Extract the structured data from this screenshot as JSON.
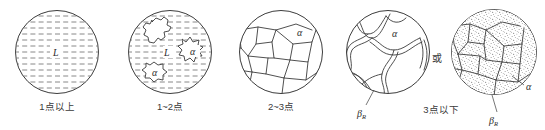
{
  "figure": {
    "title_present": false,
    "panels": [
      {
        "id": "panel-1",
        "caption": "1点以上",
        "phase_labels": [
          "L"
        ],
        "pattern": "horizontal-dashed-liquid",
        "blob_count": 0,
        "cx": 57,
        "cy": 52,
        "r": 42
      },
      {
        "id": "panel-2",
        "caption": "1~2点",
        "phase_labels": [
          "L",
          "α",
          "α"
        ],
        "pattern": "horizontal-dashed-liquid-with-alpha-blobs",
        "blob_count": 3,
        "cx": 170,
        "cy": 52,
        "r": 42
      },
      {
        "id": "panel-3",
        "caption": "2~3点",
        "phase_labels": [
          "α"
        ],
        "pattern": "polygonal-grains",
        "blob_count": 0,
        "cx": 281,
        "cy": 52,
        "r": 42
      },
      {
        "id": "panel-4",
        "caption": "3点以下",
        "phase_labels": [
          "α",
          "β",
          "R"
        ],
        "pattern": "polygonal-grains-with-beta-network",
        "blob_count": 0,
        "cx": 388,
        "cy": 52,
        "r": 42
      },
      {
        "id": "panel-5",
        "caption": "",
        "phase_labels": [
          "α",
          "β",
          "R"
        ],
        "pattern": "stippled-grains",
        "blob_count": 0,
        "cx": 494,
        "cy": 52,
        "r": 43
      }
    ],
    "connector": {
      "label": "或",
      "x": 437,
      "y": 58
    },
    "symbols": {
      "liquid": "L",
      "alpha": "α",
      "beta": "β",
      "beta_subscript": "R"
    },
    "colors": {
      "outline": "#3c3c3c",
      "hatch": "#7a7a7a",
      "text": "#3a3a3a",
      "background": "#ffffff",
      "stipple": "#555555"
    }
  }
}
